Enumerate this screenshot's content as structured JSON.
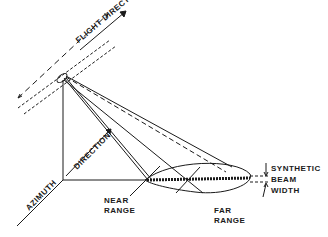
{
  "diagram": {
    "labels": {
      "flight_direction": "FLIGHT DIRECTION",
      "azimuth": "AZIMUTH",
      "direction": "DIRECTION",
      "near_range_1": "NEAR",
      "near_range_2": "RANGE",
      "far_range_1": "FAR",
      "far_range_2": "RANGE",
      "synthetic_1": "SYNTHETIC",
      "synthetic_2": "BEAM",
      "synthetic_3": "WIDTH"
    },
    "colors": {
      "ink": "#1a1a1a",
      "background": "#ffffff"
    }
  }
}
